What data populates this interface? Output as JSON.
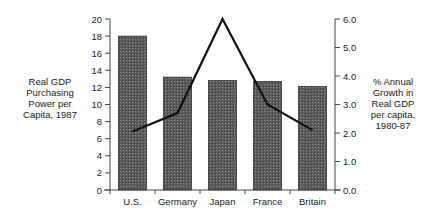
{
  "chart_data": {
    "type": "bar+line",
    "title": "",
    "categories": [
      "U.S.",
      "Germany",
      "Japan",
      "France",
      "Britain"
    ],
    "series": [
      {
        "name": "Real GDP Purchasing Power per Capita, 1987",
        "type": "bar",
        "axis": "left",
        "values": [
          18.0,
          13.2,
          12.8,
          12.7,
          12.1
        ],
        "color": "#5a5a5a"
      },
      {
        "name": "% Annual Growth in Real GDP per capita, 1980-87",
        "type": "line",
        "axis": "right",
        "values": [
          2.05,
          2.7,
          6.0,
          3.0,
          2.1
        ],
        "color": "#111111"
      }
    ],
    "ylabel_left": "Real GDP Purchasing Power per Capita, 1987",
    "ylabel_right": "% Annual Growth in Real GDP per capita, 1980-87",
    "ylim_left": [
      0,
      20
    ],
    "ylim_right": [
      0,
      6
    ],
    "yticks_left": [
      "0",
      "2",
      "4",
      "6",
      "8",
      "10",
      "12",
      "14",
      "16",
      "18",
      "20"
    ],
    "yticks_right": [
      "0.0",
      "1.0",
      "2.0",
      "3.0",
      "4.0",
      "5.0",
      "6.0"
    ],
    "grid": false,
    "legend": "none"
  },
  "labels": {
    "left": "Real GDP\nPurchasing\nPower per\nCapita, 1987",
    "right": "% Annual\nGrowth in\nReal GDP\nper capita,\n1980-87"
  }
}
